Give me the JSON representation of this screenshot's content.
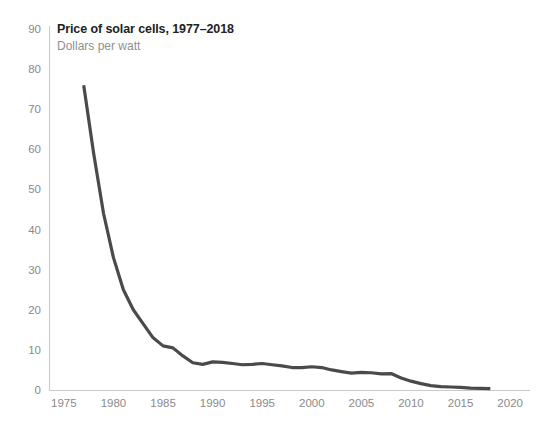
{
  "chart_data": {
    "type": "line",
    "title": "Price of solar cells, 1977–2018",
    "subtitle": "Dollars per watt",
    "xlabel": "",
    "ylabel": "",
    "xlim": [
      1973.5,
      2022
    ],
    "ylim": [
      0,
      90
    ],
    "grid": false,
    "legend": null,
    "y_ticks": [
      0,
      10,
      20,
      30,
      40,
      50,
      60,
      70,
      80,
      90
    ],
    "x_ticks": [
      1975,
      1980,
      1985,
      1990,
      1995,
      2000,
      2005,
      2010,
      2015,
      2020
    ],
    "series": [
      {
        "name": "Price of solar cells",
        "color": "#4a4a4a",
        "x": [
          1977,
          1978,
          1979,
          1980,
          1981,
          1982,
          1983,
          1984,
          1985,
          1986,
          1987,
          1988,
          1989,
          1990,
          1991,
          1992,
          1993,
          1994,
          1995,
          1996,
          1997,
          1998,
          1999,
          2000,
          2001,
          2002,
          2003,
          2004,
          2005,
          2006,
          2007,
          2008,
          2009,
          2010,
          2011,
          2012,
          2013,
          2014,
          2015,
          2016,
          2017,
          2018
        ],
        "values": [
          76.0,
          59.0,
          44.0,
          33.0,
          25.0,
          20.0,
          16.5,
          13.0,
          11.0,
          10.5,
          8.5,
          6.8,
          6.4,
          7.0,
          6.9,
          6.6,
          6.3,
          6.4,
          6.6,
          6.3,
          6.0,
          5.6,
          5.6,
          5.8,
          5.6,
          5.0,
          4.6,
          4.2,
          4.4,
          4.3,
          4.0,
          4.1,
          3.0,
          2.2,
          1.6,
          1.1,
          0.85,
          0.75,
          0.65,
          0.45,
          0.4,
          0.35
        ]
      }
    ]
  }
}
